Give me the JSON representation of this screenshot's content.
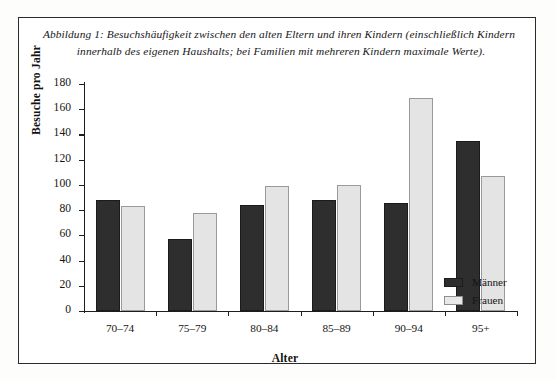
{
  "figure": {
    "caption_line_1": "Abbildung 1: Besuchshäufigkeit zwischen den alten Eltern und ihren Kindern (einschließlich Kindern",
    "caption_line_2": "innerhalb des eigenen Haushalts; bei Familien mit mehreren Kindern maximale Werte)."
  },
  "chart_data": {
    "type": "bar",
    "title": "",
    "xlabel": "Alter",
    "ylabel": "Besuche pro Jahr",
    "categories": [
      "70–74",
      "75–79",
      "80–84",
      "85–89",
      "90–94",
      "95+"
    ],
    "series": [
      {
        "name": "Männer",
        "color": "#2e2e2e",
        "values": [
          88,
          57,
          84,
          88,
          86,
          135
        ]
      },
      {
        "name": "Frauen",
        "color": "#e4e4e4",
        "values": [
          83,
          78,
          99,
          100,
          169,
          107
        ]
      }
    ],
    "ylim": [
      0,
      180
    ],
    "yticks": [
      0,
      20,
      40,
      60,
      80,
      100,
      120,
      140,
      160,
      180
    ],
    "ytick_labels": [
      "0",
      "20",
      "40",
      "60",
      "80",
      "100",
      "120",
      "140",
      "160",
      "180"
    ],
    "grid": false,
    "legend_position": "bottom-right"
  },
  "legend": {
    "entries": [
      {
        "label": "Männer"
      },
      {
        "label": "Frauen"
      }
    ]
  }
}
